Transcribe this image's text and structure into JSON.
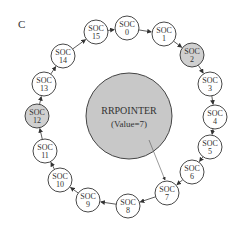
{
  "figure": {
    "label": "C",
    "pointer": {
      "title": "RRPOINTER",
      "value_text": "(Value=7)",
      "fill": "#c8c8c8",
      "points_to": 7
    },
    "node_prefix": "SOC",
    "nodes": [
      {
        "id": "0",
        "x": 127,
        "y": 28,
        "shaded": false
      },
      {
        "id": "1",
        "x": 164,
        "y": 34,
        "shaded": false
      },
      {
        "id": "2",
        "x": 192,
        "y": 55,
        "shaded": true
      },
      {
        "id": "3",
        "x": 210,
        "y": 84,
        "shaded": false
      },
      {
        "id": "4",
        "x": 215,
        "y": 117,
        "shaded": false
      },
      {
        "id": "5",
        "x": 210,
        "y": 147,
        "shaded": false
      },
      {
        "id": "6",
        "x": 192,
        "y": 172,
        "shaded": false
      },
      {
        "id": "7",
        "x": 167,
        "y": 193,
        "shaded": false
      },
      {
        "id": "8",
        "x": 128,
        "y": 206,
        "shaded": false
      },
      {
        "id": "9",
        "x": 88,
        "y": 200,
        "shaded": false
      },
      {
        "id": "10",
        "x": 60,
        "y": 180,
        "shaded": false
      },
      {
        "id": "11",
        "x": 45,
        "y": 151,
        "shaded": false
      },
      {
        "id": "12",
        "x": 37,
        "y": 116,
        "shaded": true
      },
      {
        "id": "13",
        "x": 44,
        "y": 84,
        "shaded": false
      },
      {
        "id": "14",
        "x": 63,
        "y": 56,
        "shaded": false
      },
      {
        "id": "15",
        "x": 96,
        "y": 32,
        "shaded": false
      }
    ],
    "shade_color": "#d0d0d0"
  }
}
